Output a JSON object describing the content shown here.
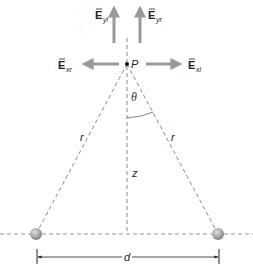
{
  "diagram": {
    "point": {
      "label": "P"
    },
    "vectors": {
      "E_yl": {
        "base": "E",
        "sub": "yl"
      },
      "E_yr": {
        "base": "E",
        "sub": "yr"
      },
      "E_xr": {
        "base": "E",
        "sub": "xr"
      },
      "E_xl": {
        "base": "E",
        "sub": "xl"
      }
    },
    "labels": {
      "theta": "θ",
      "r_left": "r",
      "r_right": "r",
      "z": "z",
      "d": "d"
    },
    "colors": {
      "arrow": "#9a9a9a",
      "dashed": "#8a8a8a",
      "charge": "#a8a8a8",
      "dimension": "#222222"
    }
  }
}
